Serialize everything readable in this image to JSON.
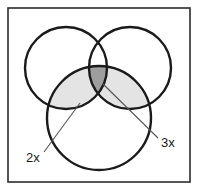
{
  "figure": {
    "background_color": "#ffffff",
    "frame": {
      "stroke_color": "#2b2b2b",
      "x": 8,
      "y": 8,
      "width": 182,
      "height": 174
    },
    "circles": [
      {
        "name": "top-left-circle",
        "cx": 66,
        "cy": 68,
        "r": 41
      },
      {
        "name": "top-right-circle",
        "cx": 130,
        "cy": 68,
        "r": 41
      },
      {
        "name": "bottom-circle",
        "cx": 99,
        "cy": 118,
        "r": 52
      }
    ],
    "circle_stroke_color": "#1a1a1a",
    "regions": [
      {
        "name": "left-lens-region",
        "fill": "#e4e4e4",
        "description": "intersection of top-left circle and bottom circle"
      },
      {
        "name": "right-lens-region",
        "fill": "#e4e4e4",
        "description": "intersection of top-right circle and bottom circle"
      },
      {
        "name": "center-triple-region",
        "fill": "#9e9e9e",
        "description": "intersection of all three circles"
      }
    ],
    "callouts": [
      {
        "name": "callout-2x",
        "label": "2x",
        "label_x": 26,
        "label_y": 162,
        "line_start_x": 44,
        "line_start_y": 152,
        "line_end_x": 80,
        "line_end_y": 103,
        "points_to": "left-lens-region"
      },
      {
        "name": "callout-3x",
        "label": "3x",
        "label_x": 161,
        "label_y": 147,
        "line_start_x": 158,
        "line_start_y": 138,
        "line_end_x": 103,
        "line_end_y": 84,
        "points_to": "center-triple-region"
      }
    ],
    "leader_line_color": "#555555",
    "text_color": "#1a1a1a"
  }
}
